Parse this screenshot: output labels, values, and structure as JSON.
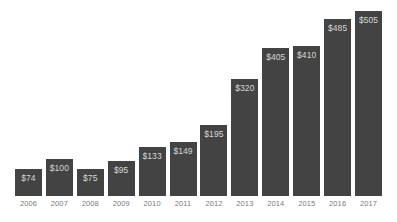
{
  "chart_data": {
    "type": "bar",
    "title": "",
    "subtitle": "",
    "xlabel": "",
    "ylabel": "",
    "categories": [
      "2006",
      "2007",
      "2008",
      "2009",
      "2010",
      "2011",
      "2012",
      "2013",
      "2014",
      "2015",
      "2016",
      "2017"
    ],
    "values": [
      74,
      100,
      75,
      95,
      133,
      149,
      195,
      320,
      405,
      410,
      485,
      505
    ],
    "data_labels": [
      "$74",
      "$100",
      "$75",
      "$95",
      "$133",
      "$149",
      "$195",
      "$320",
      "$405",
      "$410",
      "$485",
      "$505"
    ],
    "ylim": [
      0,
      520
    ],
    "grid": false,
    "legend": null,
    "annotations": [],
    "colors": {
      "bar_fill": "#434343",
      "data_label_text": "#d8d8d8",
      "axis_label_text": "#7a7a7a",
      "background": "#ffffff"
    }
  }
}
